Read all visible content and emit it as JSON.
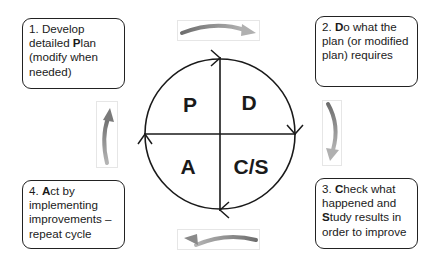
{
  "diagram": {
    "type": "PDSA cycle",
    "steps": [
      {
        "number": "1.",
        "pre": "Develop detailed ",
        "bold": "P",
        "post": "lan (modify when needed)",
        "lines": [
          "1. Develop",
          "detailed |P|lan",
          "(modify when",
          "needed)"
        ]
      },
      {
        "number": "2.",
        "lines": [
          "2. |D|o what the",
          "plan (or modified",
          "plan) requires"
        ]
      },
      {
        "number": "3.",
        "lines": [
          "3. |C|heck what",
          "happened and",
          "|S|tudy results in",
          "order to improve"
        ]
      },
      {
        "number": "4.",
        "lines": [
          "4. |A|ct by",
          "implementing",
          "improvements –",
          "repeat cycle"
        ]
      }
    ],
    "quadrants": {
      "top_left": "P",
      "top_right": "D",
      "bottom_left": "A",
      "bottom_right": "C/S"
    },
    "arrows": [
      "top-clockwise",
      "right-down",
      "bottom-left",
      "left-up"
    ],
    "colors": {
      "line": "#1a1a1a",
      "arrow": "#9a9a9a"
    }
  }
}
